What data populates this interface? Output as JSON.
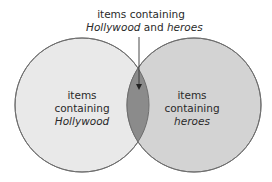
{
  "diagram": {
    "type": "venn",
    "sets": [
      {
        "id": "left",
        "label_line1": "items",
        "label_line2": "containing",
        "label_term": "Hollywood",
        "fill": "#e8e8e8"
      },
      {
        "id": "right",
        "label_line1": "items",
        "label_line2": "containing",
        "label_term": "heroes",
        "fill": "#d2d2d2"
      }
    ],
    "intersection": {
      "label_line1": "items containing",
      "term_a": "Hollywood",
      "connector": "and",
      "term_b": "heroes",
      "fill": "#8a8a8a"
    },
    "stroke": "#6a6a6a",
    "background": "#ffffff"
  }
}
